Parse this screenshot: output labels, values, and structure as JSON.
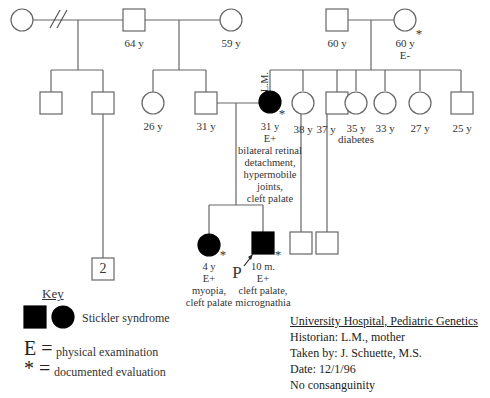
{
  "pedigree": {
    "generation1": {
      "left_couple": {
        "female_left": {
          "label": ""
        },
        "male": {
          "label": "64 y"
        },
        "female_right": {
          "label": "59 y"
        },
        "divorce_marker": "//"
      },
      "right_couple": {
        "male": {
          "label": "60 y"
        },
        "female": {
          "label": "60 y",
          "exam": "E-",
          "documented": "*"
        }
      }
    },
    "generation2": {
      "half_siblings": [
        {
          "label": ""
        },
        {
          "label": ""
        }
      ],
      "siblings_of_father": [
        {
          "sex": "female",
          "label": "26 y"
        },
        {
          "sex": "male",
          "label": "31 y"
        }
      ],
      "proband_mother": {
        "name": "L.M.",
        "age": "31 y",
        "exam": "E+",
        "documented": "*",
        "findings": [
          "bilateral retinal",
          "detachment,",
          "hypermobile",
          "joints,",
          "cleft palate"
        ]
      },
      "siblings_of_mother": [
        {
          "sex": "female",
          "label": "38 y"
        },
        {
          "sex": "male",
          "label": "37 y"
        },
        {
          "sex": "female",
          "label": "35 y",
          "note": "diabetes"
        },
        {
          "sex": "female",
          "label": "33 y"
        },
        {
          "sex": "female",
          "label": "27 y"
        },
        {
          "sex": "male",
          "label": "25 y"
        }
      ]
    },
    "generation3": {
      "multiple_males_count": "2",
      "daughter": {
        "age": "4 y",
        "exam": "E+",
        "documented": "*",
        "findings": [
          "myopia,",
          "cleft palate"
        ]
      },
      "proband": {
        "marker": "P",
        "age": "10 m.",
        "exam": "E+",
        "documented": "*",
        "findings": [
          "cleft palate,",
          "micrognathia"
        ]
      },
      "cousins": [
        {
          "sex": "male"
        },
        {
          "sex": "male"
        }
      ]
    }
  },
  "key": {
    "title": "Key",
    "affected_label": "Stickler syndrome",
    "e_symbol": "E =",
    "e_label": "physical examination",
    "star_symbol": "* =",
    "star_label": "documented evaluation"
  },
  "info": {
    "title": "University Hospital, Pediatric Genetics",
    "historian": "Historian:  L.M., mother",
    "taken_by": "Taken by:  J. Schuette, M.S.",
    "date": "Date:  12/1/96",
    "consanguinity": "No consanguinity"
  },
  "colors": {
    "line": "#555555",
    "affected": "#000000",
    "text": "#333333"
  }
}
